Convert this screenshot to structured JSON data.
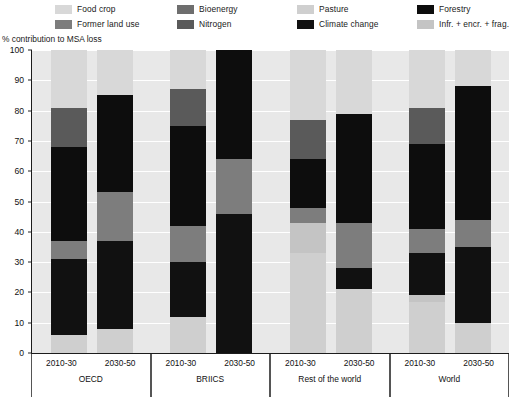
{
  "legend": {
    "items": [
      {
        "label": "Food crop",
        "color": "#d8d8d8",
        "name": "food-crop"
      },
      {
        "label": "Former land use",
        "color": "#7d7d7d",
        "name": "former-land-use"
      },
      {
        "label": "Bioenergy",
        "color": "#6e6e6e",
        "name": "bioenergy"
      },
      {
        "label": "Nitrogen",
        "color": "#5a5a5a",
        "name": "nitrogen"
      },
      {
        "label": "Pasture",
        "color": "#cfcfcf",
        "name": "pasture"
      },
      {
        "label": "Climate change",
        "color": "#111111",
        "name": "climate-change"
      },
      {
        "label": "Forestry",
        "color": "#0d0d0d",
        "name": "forestry"
      },
      {
        "label": "Infr. + encr. + frag.",
        "color": "#c4c4c4",
        "name": "infr-encr-frag"
      }
    ]
  },
  "axis": {
    "y_title": "% contribution to MSA loss",
    "y_ticks": [
      0,
      10,
      20,
      30,
      40,
      50,
      60,
      70,
      80,
      90,
      100
    ]
  },
  "chart_data": {
    "type": "bar",
    "title": "",
    "subtitle": "",
    "xlabel": "",
    "ylabel": "% contribution to MSA loss",
    "ylim": [
      0,
      100
    ],
    "grid": true,
    "stacked": true,
    "legend_position": "top",
    "categories": [
      "OECD 2010-30",
      "OECD 2030-50",
      "BRIICS 2010-30",
      "BRIICS 2030-50",
      "Rest of the world 2010-30",
      "Rest of the world 2030-50",
      "World 2010-30",
      "World 2030-50"
    ],
    "groups": [
      {
        "name": "OECD",
        "bars": [
          {
            "period": "2010-30",
            "segments": [
              {
                "series": "Pasture",
                "value": 6
              },
              {
                "series": "Climate change",
                "value": 25
              },
              {
                "series": "Former land use",
                "value": 6
              },
              {
                "series": "Forestry",
                "value": 31
              },
              {
                "series": "Nitrogen",
                "value": 13
              },
              {
                "series": "Food crop",
                "value": 19
              }
            ]
          },
          {
            "period": "2030-50",
            "segments": [
              {
                "series": "Pasture",
                "value": 8
              },
              {
                "series": "Climate change",
                "value": 29
              },
              {
                "series": "Former land use",
                "value": 16
              },
              {
                "series": "Forestry",
                "value": 32
              },
              {
                "series": "Food crop",
                "value": 15
              }
            ]
          }
        ]
      },
      {
        "name": "BRIICS",
        "bars": [
          {
            "period": "2010-30",
            "segments": [
              {
                "series": "Pasture",
                "value": 12
              },
              {
                "series": "Climate change",
                "value": 18
              },
              {
                "series": "Former land use",
                "value": 12
              },
              {
                "series": "Forestry",
                "value": 33
              },
              {
                "series": "Nitrogen",
                "value": 12
              },
              {
                "series": "Food crop",
                "value": 13
              }
            ]
          },
          {
            "period": "2030-50",
            "segments": [
              {
                "series": "Climate change",
                "value": 46
              },
              {
                "series": "Former land use",
                "value": 18
              },
              {
                "series": "Forestry",
                "value": 36
              }
            ]
          }
        ]
      },
      {
        "name": "Rest of the world",
        "bars": [
          {
            "period": "2010-30",
            "segments": [
              {
                "series": "Pasture",
                "value": 33
              },
              {
                "series": "Infr. + encr. + frag.",
                "value": 10
              },
              {
                "series": "Former land use",
                "value": 5
              },
              {
                "series": "Forestry",
                "value": 16
              },
              {
                "series": "Nitrogen",
                "value": 13
              },
              {
                "series": "Food crop",
                "value": 23
              }
            ]
          },
          {
            "period": "2030-50",
            "segments": [
              {
                "series": "Pasture",
                "value": 21
              },
              {
                "series": "Climate change",
                "value": 7
              },
              {
                "series": "Former land use",
                "value": 15
              },
              {
                "series": "Forestry",
                "value": 36
              },
              {
                "series": "Food crop",
                "value": 21
              }
            ]
          }
        ]
      },
      {
        "name": "World",
        "bars": [
          {
            "period": "2010-30",
            "segments": [
              {
                "series": "Pasture",
                "value": 17
              },
              {
                "series": "Infr. + encr. + frag.",
                "value": 2
              },
              {
                "series": "Climate change",
                "value": 14
              },
              {
                "series": "Former land use",
                "value": 8
              },
              {
                "series": "Forestry",
                "value": 28
              },
              {
                "series": "Nitrogen",
                "value": 12
              },
              {
                "series": "Food crop",
                "value": 19
              }
            ]
          },
          {
            "period": "2030-50",
            "segments": [
              {
                "series": "Pasture",
                "value": 10
              },
              {
                "series": "Climate change",
                "value": 25
              },
              {
                "series": "Former land use",
                "value": 9
              },
              {
                "series": "Forestry",
                "value": 44
              },
              {
                "series": "Food crop",
                "value": 12
              }
            ]
          }
        ]
      }
    ],
    "series_colors": {
      "Food crop": "#d8d8d8",
      "Former land use": "#7d7d7d",
      "Bioenergy": "#6e6e6e",
      "Nitrogen": "#5a5a5a",
      "Pasture": "#cfcfcf",
      "Climate change": "#111111",
      "Forestry": "#0d0d0d",
      "Infr. + encr. + frag.": "#c4c4c4"
    }
  }
}
